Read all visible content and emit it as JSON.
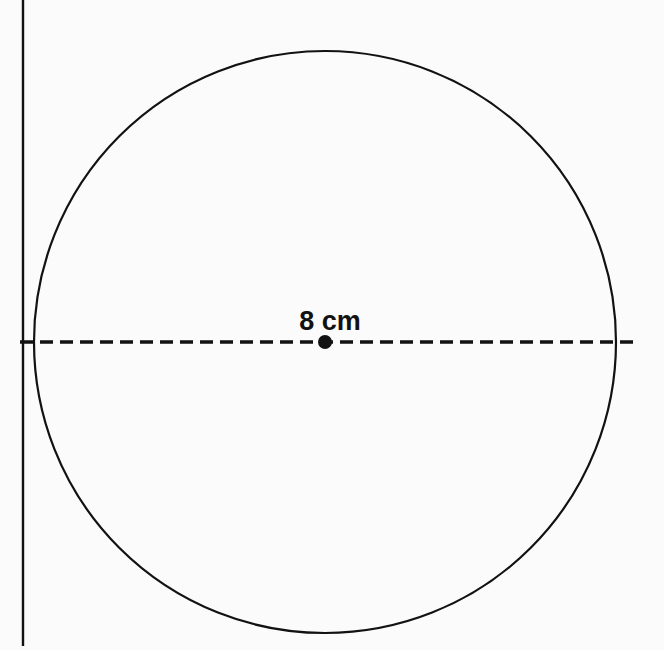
{
  "figure": {
    "background_color": "#fbfbfb",
    "ink_color": "#121212"
  },
  "labels": {
    "diameter_label": "8 cm"
  },
  "geometry": {
    "canvas": {
      "width": 664,
      "height": 650
    },
    "vertical_line": {
      "name": "vertical-line",
      "x": 23,
      "y_start": 0,
      "y_end": 646,
      "stroke_width": 2.4,
      "color": "#121212"
    },
    "circle": {
      "name": "circle",
      "center_x": 325,
      "center_y": 342,
      "radius": 291,
      "stroke_width": 2.2,
      "fill": "none",
      "color": "#121212"
    },
    "diameter_line": {
      "name": "diameter-dashed-line",
      "x_start": 20,
      "x_end": 634,
      "y": 342,
      "stroke_width": 3.4,
      "dash": "13 7",
      "color": "#121212"
    },
    "center_dot": {
      "name": "center-point",
      "cx": 325,
      "cy": 342,
      "r": 7,
      "color": "#121212"
    },
    "label_position": {
      "x": 330,
      "y": 330,
      "font_size": 27,
      "anchor": "middle"
    }
  }
}
